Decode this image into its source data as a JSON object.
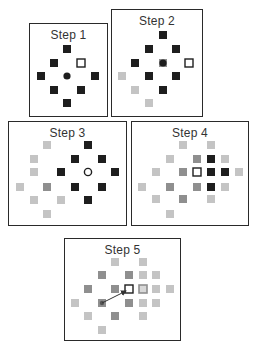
{
  "colors": {
    "black": "#1e1e1e",
    "mid": "#8f8f8f",
    "light": "#c4c4c4",
    "border": "#2a2a2a",
    "circle": "#1e1e1e",
    "arrow": "#333333"
  },
  "steps": [
    {
      "title": "Step 1",
      "box": {
        "x": 29,
        "y": 23,
        "w": 79,
        "h": 94
      },
      "title_y": 27,
      "cells": [
        {
          "x": 67,
          "y": 49,
          "t": "black"
        },
        {
          "x": 54,
          "y": 63,
          "t": "black"
        },
        {
          "x": 81,
          "y": 63,
          "t": "open"
        },
        {
          "x": 41,
          "y": 76,
          "t": "black"
        },
        {
          "x": 95,
          "y": 76,
          "t": "black"
        },
        {
          "x": 54,
          "y": 90,
          "t": "black"
        },
        {
          "x": 81,
          "y": 90,
          "t": "black"
        },
        {
          "x": 67,
          "y": 103,
          "t": "black"
        }
      ],
      "circle": {
        "x": 67,
        "y": 76,
        "filled": true
      },
      "arrow": null
    },
    {
      "title": "Step 2",
      "box": {
        "x": 111,
        "y": 9,
        "w": 92,
        "h": 108
      },
      "title_y": 13,
      "cells": [
        {
          "x": 163,
          "y": 35,
          "t": "black"
        },
        {
          "x": 149,
          "y": 49,
          "t": "black"
        },
        {
          "x": 176,
          "y": 49,
          "t": "black"
        },
        {
          "x": 135,
          "y": 63,
          "t": "black"
        },
        {
          "x": 163,
          "y": 63,
          "t": "mid"
        },
        {
          "x": 189,
          "y": 63,
          "t": "open"
        },
        {
          "x": 122,
          "y": 76,
          "t": "light"
        },
        {
          "x": 149,
          "y": 76,
          "t": "black"
        },
        {
          "x": 176,
          "y": 76,
          "t": "black"
        },
        {
          "x": 135,
          "y": 90,
          "t": "light"
        },
        {
          "x": 163,
          "y": 90,
          "t": "black"
        },
        {
          "x": 149,
          "y": 103,
          "t": "light"
        }
      ],
      "circle": {
        "x": 163,
        "y": 63,
        "filled": true
      },
      "arrow": null
    },
    {
      "title": "Step 3",
      "box": {
        "x": 8,
        "y": 121,
        "w": 119,
        "h": 105
      },
      "title_y": 125,
      "cells": [
        {
          "x": 47,
          "y": 145,
          "t": "light"
        },
        {
          "x": 88,
          "y": 145,
          "t": "black"
        },
        {
          "x": 34,
          "y": 159,
          "t": "light"
        },
        {
          "x": 75,
          "y": 159,
          "t": "black"
        },
        {
          "x": 102,
          "y": 159,
          "t": "black"
        },
        {
          "x": 20,
          "y": 172,
          "t": "none"
        },
        {
          "x": 34,
          "y": 172,
          "t": "light"
        },
        {
          "x": 61,
          "y": 172,
          "t": "black"
        },
        {
          "x": 115,
          "y": 172,
          "t": "black"
        },
        {
          "x": 20,
          "y": 187,
          "t": "light"
        },
        {
          "x": 47,
          "y": 187,
          "t": "mid"
        },
        {
          "x": 75,
          "y": 187,
          "t": "black"
        },
        {
          "x": 102,
          "y": 187,
          "t": "black"
        },
        {
          "x": 34,
          "y": 200,
          "t": "light"
        },
        {
          "x": 61,
          "y": 200,
          "t": "light"
        },
        {
          "x": 88,
          "y": 200,
          "t": "black"
        },
        {
          "x": 47,
          "y": 214,
          "t": "light"
        }
      ],
      "circle": {
        "x": 88,
        "y": 172,
        "filled": false
      },
      "arrow": null
    },
    {
      "title": "Step 4",
      "box": {
        "x": 131,
        "y": 121,
        "w": 118,
        "h": 105
      },
      "title_y": 125,
      "cells": [
        {
          "x": 183,
          "y": 145,
          "t": "light"
        },
        {
          "x": 211,
          "y": 145,
          "t": "light"
        },
        {
          "x": 170,
          "y": 159,
          "t": "light"
        },
        {
          "x": 197,
          "y": 159,
          "t": "mid"
        },
        {
          "x": 211,
          "y": 159,
          "t": "black"
        },
        {
          "x": 225,
          "y": 159,
          "t": "light"
        },
        {
          "x": 156,
          "y": 172,
          "t": "light"
        },
        {
          "x": 183,
          "y": 172,
          "t": "mid"
        },
        {
          "x": 197,
          "y": 172,
          "t": "open"
        },
        {
          "x": 211,
          "y": 172,
          "t": "black"
        },
        {
          "x": 225,
          "y": 172,
          "t": "black"
        },
        {
          "x": 239,
          "y": 172,
          "t": "light"
        },
        {
          "x": 142,
          "y": 187,
          "t": "light"
        },
        {
          "x": 170,
          "y": 187,
          "t": "mid"
        },
        {
          "x": 197,
          "y": 187,
          "t": "mid"
        },
        {
          "x": 211,
          "y": 187,
          "t": "black"
        },
        {
          "x": 225,
          "y": 187,
          "t": "light"
        },
        {
          "x": 156,
          "y": 199,
          "t": "light"
        },
        {
          "x": 183,
          "y": 199,
          "t": "mid"
        },
        {
          "x": 211,
          "y": 199,
          "t": "light"
        },
        {
          "x": 170,
          "y": 214,
          "t": "light"
        }
      ],
      "circle": {
        "x": 211,
        "y": 172,
        "filled": true
      },
      "arrow": null
    },
    {
      "title": "Step 5",
      "box": {
        "x": 64,
        "y": 238,
        "w": 117,
        "h": 103
      },
      "title_y": 242,
      "cells": [
        {
          "x": 115,
          "y": 262,
          "t": "light"
        },
        {
          "x": 143,
          "y": 262,
          "t": "light"
        },
        {
          "x": 102,
          "y": 275,
          "t": "mid"
        },
        {
          "x": 129,
          "y": 275,
          "t": "mid"
        },
        {
          "x": 143,
          "y": 275,
          "t": "light"
        },
        {
          "x": 156,
          "y": 275,
          "t": "light"
        },
        {
          "x": 88,
          "y": 289,
          "t": "mid"
        },
        {
          "x": 115,
          "y": 289,
          "t": "mid"
        },
        {
          "x": 129,
          "y": 289,
          "t": "open"
        },
        {
          "x": 143,
          "y": 289,
          "t": "ring"
        },
        {
          "x": 156,
          "y": 289,
          "t": "light"
        },
        {
          "x": 170,
          "y": 289,
          "t": "light"
        },
        {
          "x": 75,
          "y": 303,
          "t": "light"
        },
        {
          "x": 102,
          "y": 303,
          "t": "mid"
        },
        {
          "x": 129,
          "y": 303,
          "t": "mid"
        },
        {
          "x": 143,
          "y": 303,
          "t": "light"
        },
        {
          "x": 156,
          "y": 303,
          "t": "light"
        },
        {
          "x": 88,
          "y": 316,
          "t": "light"
        },
        {
          "x": 115,
          "y": 316,
          "t": "mid"
        },
        {
          "x": 143,
          "y": 316,
          "t": "light"
        },
        {
          "x": 102,
          "y": 330,
          "t": "light"
        }
      ],
      "circle": {
        "x": 102,
        "y": 303,
        "filled": true,
        "small": true
      },
      "arrow": {
        "x1": 102,
        "y1": 303,
        "x2": 126,
        "y2": 291
      }
    }
  ]
}
